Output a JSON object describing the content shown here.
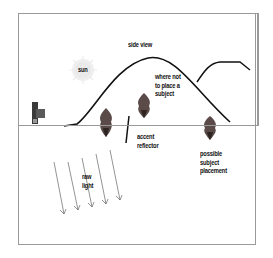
{
  "diagram": {
    "title": "side view",
    "labels": {
      "sun": "sun",
      "where_not": "where not\nto place a\nsubject",
      "accent_reflector": "accent\nreflector",
      "possible_placement": "possible\nsubject\nplacement",
      "raw_light": "raw\nlight"
    },
    "icons": [
      "sun-icon",
      "camera-icon",
      "subject-shape",
      "reflector-line",
      "light-ray-arrow"
    ],
    "colors": {
      "frame_border": "#9a9a9a",
      "subject_fill": "#5a4a48",
      "subject_dark": "#2e2523",
      "sun_glow": "#e6e6e6",
      "line": "#111111",
      "arrow": "#555555"
    }
  }
}
